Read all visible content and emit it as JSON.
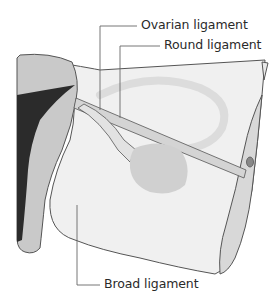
{
  "figure": {
    "labels": {
      "ovarian": "Ovarian ligament",
      "round": "Round ligament",
      "broad": "Broad ligament"
    },
    "colors": {
      "background": "#ffffff",
      "outline": "#555555",
      "uterus_gray": "#c9c9c9",
      "dark_cavity": "#2b2b2b",
      "ligament_fill": "#efefef",
      "tube_band": "#d8d8d8",
      "ovary": "#d2d2d2",
      "leader_line": "#666666"
    }
  }
}
